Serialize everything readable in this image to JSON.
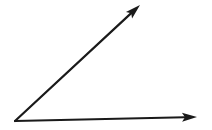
{
  "page": {
    "background_color": "#ffffff"
  },
  "figure": {
    "canvas": {
      "width": 212,
      "height": 130
    },
    "stroke_color": "#1a1a1a",
    "stroke_width": 2.2,
    "arrowhead": {
      "length": 15,
      "half_width": 4.5
    },
    "vertex": {
      "x": 15,
      "y": 121
    },
    "rays": [
      {
        "name": "horizontal-ray",
        "tip": {
          "x": 197,
          "y": 117
        }
      },
      {
        "name": "diagonal-ray",
        "tip": {
          "x": 140,
          "y": 5
        }
      }
    ]
  }
}
